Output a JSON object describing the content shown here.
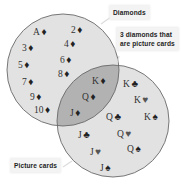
{
  "labels": {
    "diamonds": "Diamonds",
    "intersection_line1": "3 diamonds that",
    "intersection_line2": "are picture cards",
    "picture_cards": "Picture cards"
  },
  "colors": {
    "circle_fill": "#e2e2e2",
    "overlap_fill": "#b2b2b2",
    "outline": "#6a6a6a",
    "background": "#ffffff"
  },
  "regions": {
    "diamonds_only": [
      {
        "rank": "A",
        "suit": "♦"
      },
      {
        "rank": "2",
        "suit": "♦"
      },
      {
        "rank": "3",
        "suit": "♦"
      },
      {
        "rank": "4",
        "suit": "♦"
      },
      {
        "rank": "5",
        "suit": "♦"
      },
      {
        "rank": "6",
        "suit": "♦"
      },
      {
        "rank": "7",
        "suit": "♦"
      },
      {
        "rank": "8",
        "suit": "♦"
      },
      {
        "rank": "9",
        "suit": "♦"
      },
      {
        "rank": "10",
        "suit": "♦"
      }
    ],
    "overlap": [
      {
        "rank": "K",
        "suit": "♦"
      },
      {
        "rank": "Q",
        "suit": "♦"
      },
      {
        "rank": "J",
        "suit": "♦"
      }
    ],
    "picture_only": [
      {
        "rank": "K",
        "suit": "♣"
      },
      {
        "rank": "K",
        "suit": "♥"
      },
      {
        "rank": "K",
        "suit": "♠"
      },
      {
        "rank": "Q",
        "suit": "♣"
      },
      {
        "rank": "Q",
        "suit": "♥"
      },
      {
        "rank": "Q",
        "suit": "♠"
      },
      {
        "rank": "J",
        "suit": "♣"
      },
      {
        "rank": "J",
        "suit": "♥"
      },
      {
        "rank": "J",
        "suit": "♠"
      }
    ]
  }
}
